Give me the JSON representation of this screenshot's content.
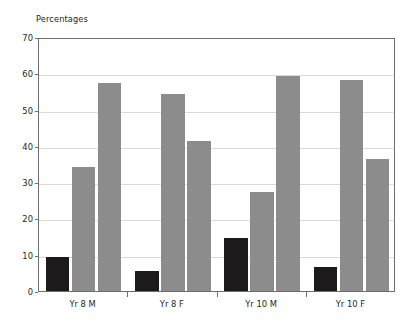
{
  "chart_data": {
    "type": "bar",
    "title": "Percentages",
    "xlabel": "",
    "ylabel": "",
    "ylim": [
      0,
      70
    ],
    "yticks": [
      0,
      10,
      20,
      30,
      40,
      50,
      60,
      70
    ],
    "grid": true,
    "legend": "none",
    "categories": [
      "Yr 8 M",
      "Yr 8 F",
      "Yr 10 M",
      "Yr 10 F"
    ],
    "series": [
      {
        "name": "series-1",
        "color": "#1c1a1a",
        "values": [
          9.5,
          5.5,
          14.5,
          6.5
        ]
      },
      {
        "name": "series-2",
        "color": "#8c8c8c",
        "values": [
          34.3,
          54.3,
          27.2,
          58.2
        ]
      },
      {
        "name": "series-3",
        "color": "#8c8c8c",
        "values": [
          57.3,
          41.3,
          59.3,
          36.4
        ]
      }
    ]
  },
  "axis": {
    "y_tick_labels": [
      "70",
      "60",
      "50",
      "40",
      "30",
      "20",
      "10",
      "0"
    ],
    "x_tick_labels": [
      "Yr 8 M",
      "Yr 8 F",
      "Yr 10 M",
      "Yr 10 F"
    ]
  },
  "colors": {
    "bar_dark": "#1c1a1a",
    "bar_gray": "#8c8c8c",
    "gridline": "#d9dadb",
    "axis": "#6d6e71",
    "text": "#231f20",
    "background": "#ffffff"
  }
}
